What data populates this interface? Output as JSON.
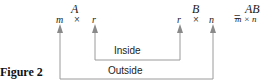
{
  "figure_label": "Figure 2",
  "matrix_a": {
    "name": "A",
    "rows": "m",
    "times": "×",
    "cols": "r"
  },
  "matrix_b": {
    "name": "B",
    "rows": "r",
    "times": "×",
    "cols": "n"
  },
  "equals": "=",
  "product": {
    "name": "AB",
    "dims": "m × n"
  },
  "connectors": {
    "inside_label": "Inside",
    "outside_label": "Outside"
  },
  "colors": {
    "line": "#9a9a9a",
    "arrow": "#8a8a8a",
    "text": "#1a1a1a"
  }
}
